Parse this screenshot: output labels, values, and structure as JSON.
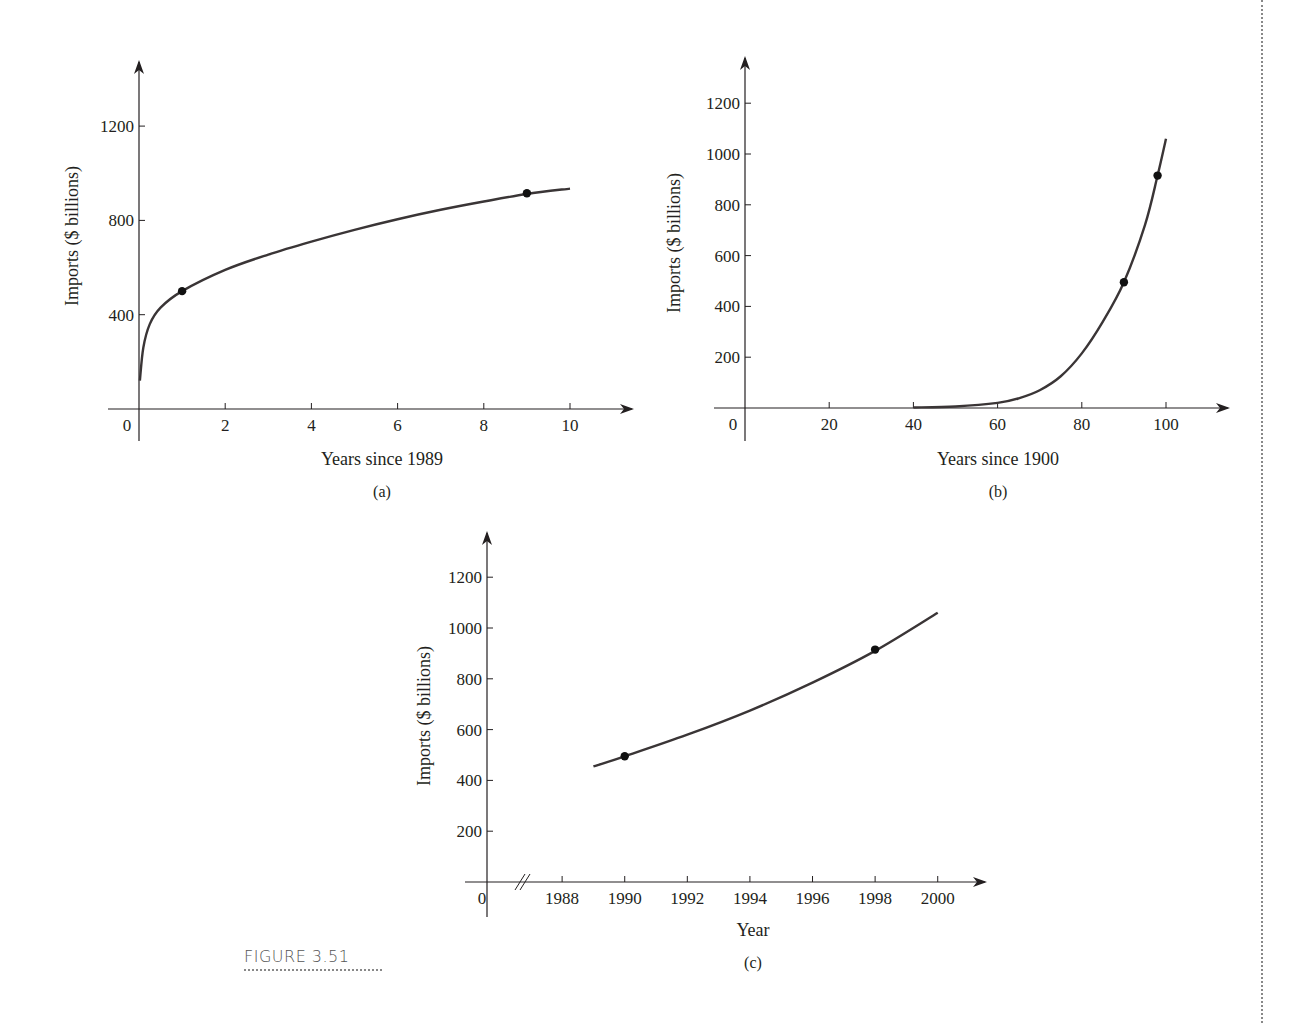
{
  "figure": {
    "label": "FIGURE 3.51"
  },
  "chart_data": [
    {
      "panel": "(a)",
      "type": "line",
      "title": "",
      "xlabel": "Years since 1989",
      "ylabel": "Imports ($ billions)",
      "xlim": [
        0,
        11
      ],
      "ylim": [
        0,
        1350
      ],
      "xticks": [
        0,
        2,
        4,
        6,
        8,
        10
      ],
      "yticks": [
        400,
        800,
        1200
      ],
      "grid": false,
      "series": [
        {
          "name": "logarithmic model",
          "x": [
            0.02,
            0.1,
            0.25,
            0.5,
            1,
            2,
            3,
            4,
            5,
            6,
            7,
            8,
            9,
            10
          ],
          "values": [
            120,
            260,
            360,
            430,
            500,
            590,
            655,
            710,
            760,
            805,
            845,
            880,
            912,
            935
          ]
        }
      ],
      "points": [
        {
          "x": 1,
          "y": 500
        },
        {
          "x": 9,
          "y": 915
        }
      ]
    },
    {
      "panel": "(b)",
      "type": "line",
      "title": "",
      "xlabel": "Years since 1900",
      "ylabel": "Imports ($ billions)",
      "xlim": [
        0,
        112
      ],
      "ylim": [
        0,
        1300
      ],
      "xticks": [
        0,
        20,
        40,
        60,
        80,
        100
      ],
      "yticks": [
        200,
        400,
        600,
        800,
        1000,
        1200
      ],
      "grid": false,
      "series": [
        {
          "name": "exponential model in t",
          "x": [
            40,
            50,
            60,
            65,
            70,
            75,
            80,
            85,
            90,
            95,
            98,
            100
          ],
          "values": [
            2,
            6,
            20,
            38,
            70,
            125,
            215,
            340,
            495,
            720,
            915,
            1060
          ]
        }
      ],
      "points": [
        {
          "x": 90,
          "y": 495
        },
        {
          "x": 98,
          "y": 915
        }
      ]
    },
    {
      "panel": "(c)",
      "type": "line",
      "title": "",
      "xlabel": "Year",
      "ylabel": "Imports ($ billions)",
      "xlim": [
        1985,
        2001.5
      ],
      "ylim": [
        0,
        1300
      ],
      "xticks": [
        "0",
        "1988",
        "1990",
        "1992",
        "1994",
        "1996",
        "1998",
        "2000"
      ],
      "yticks": [
        200,
        400,
        600,
        800,
        1000,
        1200
      ],
      "axis_break": true,
      "grid": false,
      "series": [
        {
          "name": "exponential model in year",
          "x": [
            1989,
            1990,
            1992,
            1994,
            1996,
            1998,
            2000
          ],
          "values": [
            455,
            495,
            580,
            675,
            785,
            910,
            1060
          ]
        }
      ],
      "points": [
        {
          "x": 1990,
          "y": 495
        },
        {
          "x": 1998,
          "y": 915
        }
      ]
    }
  ]
}
